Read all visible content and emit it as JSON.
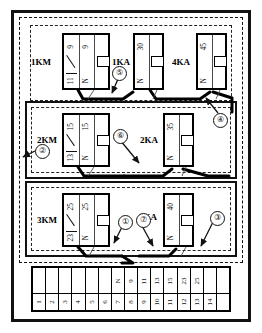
{
  "diagram": {
    "colors": {
      "line": "#111111",
      "background": "#ffffff",
      "wire_bold": "#000000"
    }
  },
  "devices": [
    {
      "id": "1KM",
      "name": "1KM",
      "type": "contactor",
      "row": 1,
      "terminals_top": [
        "9",
        "9"
      ],
      "terminals_bottom": [
        "11",
        "N"
      ],
      "has_contact_blade": true,
      "has_coil": true
    },
    {
      "id": "1KA",
      "name": "1KA",
      "type": "relay",
      "row": 1,
      "terminals_top": [
        "30"
      ],
      "terminals_bottom": [
        "N"
      ],
      "has_contact_blade": false,
      "has_coil": true
    },
    {
      "id": "4KA",
      "name": "4KA",
      "type": "relay",
      "row": 1,
      "terminals_top": [
        "45"
      ],
      "terminals_bottom": [
        "N"
      ],
      "has_contact_blade": false,
      "has_coil": true
    },
    {
      "id": "2KM",
      "name": "2KM",
      "type": "contactor",
      "row": 2,
      "terminals_top": [
        "15",
        "15"
      ],
      "terminals_bottom": [
        "13",
        "N"
      ],
      "has_contact_blade": true,
      "has_coil": true
    },
    {
      "id": "2KA",
      "name": "2KA",
      "type": "relay",
      "row": 2,
      "terminals_top": [
        "35"
      ],
      "terminals_bottom": [
        "N"
      ],
      "has_contact_blade": false,
      "has_coil": true
    },
    {
      "id": "3KM",
      "name": "3KM",
      "type": "contactor",
      "row": 3,
      "terminals_top": [
        "25",
        "25"
      ],
      "terminals_bottom": [
        "23",
        "N"
      ],
      "has_contact_blade": true,
      "has_coil": true
    },
    {
      "id": "3KA",
      "name": "3KA",
      "type": "relay",
      "row": 3,
      "terminals_top": [
        "40"
      ],
      "terminals_bottom": [
        "N"
      ],
      "has_contact_blade": false,
      "has_coil": true
    }
  ],
  "callouts": [
    {
      "id": "c1",
      "label": "①"
    },
    {
      "id": "c2",
      "label": "②"
    },
    {
      "id": "c3",
      "label": "③"
    },
    {
      "id": "c4",
      "label": "④"
    },
    {
      "id": "c5",
      "label": "⑤"
    },
    {
      "id": "c6",
      "label": "⑥"
    },
    {
      "id": "c7",
      "label": "⑦"
    }
  ],
  "terminal_strip": {
    "name": "terminal-strip",
    "cells": [
      {
        "top": "",
        "bottom": "1"
      },
      {
        "top": "",
        "bottom": "2"
      },
      {
        "top": "",
        "bottom": "3"
      },
      {
        "top": "",
        "bottom": "4"
      },
      {
        "top": "",
        "bottom": "5"
      },
      {
        "top": "",
        "bottom": "6"
      },
      {
        "top": "N",
        "bottom": "7"
      },
      {
        "top": "9",
        "bottom": "8"
      },
      {
        "top": "11",
        "bottom": "9"
      },
      {
        "top": "13",
        "bottom": "10"
      },
      {
        "top": "15",
        "bottom": "11"
      },
      {
        "top": "23",
        "bottom": "12"
      },
      {
        "top": "25",
        "bottom": "13"
      },
      {
        "top": "",
        "bottom": "14"
      },
      {
        "top": "",
        "bottom": ""
      }
    ]
  }
}
